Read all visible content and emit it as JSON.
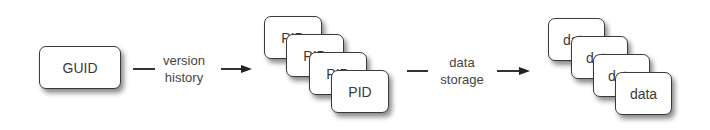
{
  "diagram": {
    "nodes": {
      "guid": {
        "label": "GUID"
      },
      "pid_stack": {
        "labels": [
          "PID",
          "PID",
          "PID",
          "PID"
        ]
      },
      "data_stack": {
        "labels": [
          "data",
          "data",
          "data",
          "data"
        ]
      }
    },
    "edges": [
      {
        "from": "guid",
        "to": "pid_stack",
        "label_line1": "version",
        "label_line2": "history"
      },
      {
        "from": "pid_stack",
        "to": "data_stack",
        "label_line1": "data",
        "label_line2": "storage"
      }
    ],
    "colors": {
      "stroke": "#3a3a3a",
      "text": "#3a3a3a",
      "background": "#ffffff"
    }
  }
}
